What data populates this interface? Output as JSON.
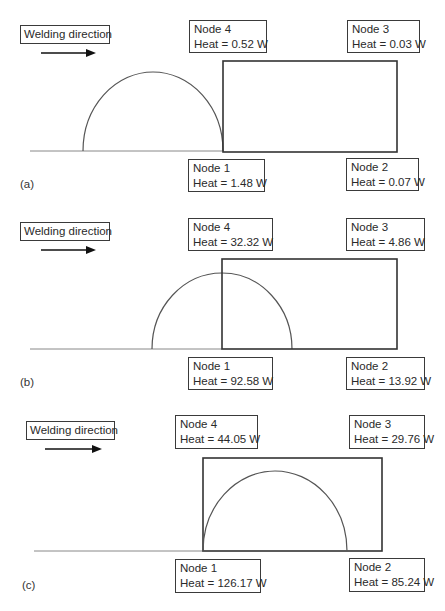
{
  "figure": {
    "welding_direction_label": "Welding direction",
    "panels": [
      {
        "id": "a",
        "label": "(a)",
        "nodes": {
          "node4": {
            "name": "Node 4",
            "heat": "Heat = 0.52 W"
          },
          "node3": {
            "name": "Node 3",
            "heat": "Heat = 0.03 W"
          },
          "node1": {
            "name": "Node 1",
            "heat": "Heat = 1.48 W"
          },
          "node2": {
            "name": "Node 2",
            "heat": "Heat = 0.07 W"
          }
        }
      },
      {
        "id": "b",
        "label": "(b)",
        "nodes": {
          "node4": {
            "name": "Node 4",
            "heat": "Heat = 32.32 W"
          },
          "node3": {
            "name": "Node 3",
            "heat": "Heat = 4.86 W"
          },
          "node1": {
            "name": "Node 1",
            "heat": "Heat = 92.58 W"
          },
          "node2": {
            "name": "Node 2",
            "heat": "Heat = 13.92 W"
          }
        }
      },
      {
        "id": "c",
        "label": "(c)",
        "nodes": {
          "node4": {
            "name": "Node 4",
            "heat": "Heat = 44.05 W"
          },
          "node3": {
            "name": "Node 3",
            "heat": "Heat = 29.76 W"
          },
          "node1": {
            "name": "Node 1",
            "heat": "Heat = 126.17 W"
          },
          "node2": {
            "name": "Node 2",
            "heat": "Heat = 85.24 W"
          }
        }
      }
    ],
    "colors": {
      "line": "#3a3a3a",
      "arc": "#555555",
      "baseline": "#777777"
    }
  }
}
